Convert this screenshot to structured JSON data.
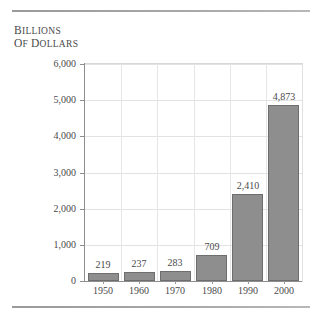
{
  "figure": {
    "y_axis_title_line1": "Billions",
    "y_axis_title_line2": "of dollars",
    "top_rule": "horizontal-rule",
    "bottom_rule": "horizontal-rule"
  },
  "chart_data": {
    "type": "bar",
    "title": "",
    "subtitle": "",
    "xlabel": "",
    "ylabel": "Billions of dollars",
    "categories": [
      "1950",
      "1960",
      "1970",
      "1980",
      "1990",
      "2000"
    ],
    "values": [
      219,
      237,
      283,
      709,
      2410,
      4873
    ],
    "data_labels": [
      "219",
      "237",
      "283",
      "709",
      "2,410",
      "4,873"
    ],
    "ylim": [
      0,
      6000
    ],
    "ytick_values": [
      0,
      1000,
      2000,
      3000,
      4000,
      5000,
      6000
    ],
    "ytick_labels": [
      "0",
      "1,000",
      "2,000",
      "3,000",
      "4,000",
      "5,000",
      "6,000"
    ],
    "grid": "horizontal-and-vertical",
    "legend": "none",
    "bar_color": "#8e8e8e",
    "bar_edge_color": "#6e6e6e",
    "grid_color": "#e2e2e2",
    "axis_color": "#8e8e8e",
    "text_color": "#4a4a4a",
    "background": "#ffffff"
  }
}
